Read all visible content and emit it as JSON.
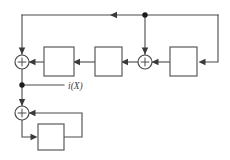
{
  "diagram": {
    "background_color": "#ffffff",
    "line_color": "#4a4a4a",
    "block_fill": "#ffffff",
    "block_stroke": "#5a5a5a",
    "dot_color": "#1a1a1a",
    "width": 230,
    "height": 160,
    "labels": {
      "signal_i_of_x": "i(X)"
    },
    "adders": [
      {
        "id": "adder-left-main",
        "symbol": "+",
        "cx": 22,
        "cy": 62,
        "r": 7
      },
      {
        "id": "adder-mid-main",
        "symbol": "+",
        "cx": 145,
        "cy": 62,
        "r": 7
      },
      {
        "id": "adder-bottom",
        "symbol": "+",
        "cx": 22,
        "cy": 113,
        "r": 7
      }
    ],
    "blocks": [
      {
        "id": "block-1",
        "label": "",
        "x": 44,
        "y": 47,
        "w": 30,
        "h": 29
      },
      {
        "id": "block-2",
        "label": "",
        "x": 95,
        "y": 47,
        "w": 27,
        "h": 29
      },
      {
        "id": "block-3",
        "label": "",
        "x": 170,
        "y": 47,
        "w": 27,
        "h": 29
      },
      {
        "id": "block-4",
        "label": "",
        "x": 38,
        "y": 124,
        "w": 26,
        "h": 26
      }
    ],
    "junctions": [
      {
        "id": "junction-top-feedback",
        "cx": 145,
        "cy": 15,
        "r": 2.6
      },
      {
        "id": "junction-output-tap",
        "cx": 22,
        "cy": 85,
        "r": 2.6
      }
    ]
  }
}
